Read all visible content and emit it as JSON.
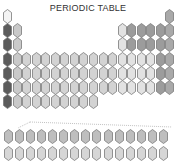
{
  "title": "PERIODIC TABLE",
  "colors": {
    "hydrogen": "#f4f4f4",
    "alkali": "#5c5c5c",
    "alkaline": "#c9c9c9",
    "transition": "#d3d3d3",
    "post_transition": "#e2e2e2",
    "pblock": "#9c9c9c",
    "noble": "#a9a9a9",
    "lanthanide": "#bebebe",
    "actinide": "#d6d6d6",
    "outline": "#7a7a7a"
  },
  "layout": {
    "columns": 18,
    "periods": 7,
    "f_block_rows": 2,
    "f_block_length": 15
  },
  "rows": [
    [
      "hydrogen",
      null,
      null,
      null,
      null,
      null,
      null,
      null,
      null,
      null,
      null,
      null,
      null,
      null,
      null,
      null,
      null,
      "noble"
    ],
    [
      "alkali",
      "alkaline",
      null,
      null,
      null,
      null,
      null,
      null,
      null,
      null,
      null,
      null,
      "post_transition",
      "pblock",
      "pblock",
      "pblock",
      "pblock",
      "noble"
    ],
    [
      "alkali",
      "alkaline",
      null,
      null,
      null,
      null,
      null,
      null,
      null,
      null,
      null,
      null,
      "post_transition",
      "pblock",
      "pblock",
      "pblock",
      "pblock",
      "noble"
    ],
    [
      "alkali",
      "alkaline",
      "transition",
      "transition",
      "transition",
      "transition",
      "transition",
      "transition",
      "transition",
      "transition",
      "transition",
      "transition",
      "post_transition",
      "post_transition",
      "post_transition",
      "post_transition",
      "pblock",
      "noble"
    ],
    [
      "alkali",
      "alkaline",
      "transition",
      "transition",
      "transition",
      "transition",
      "transition",
      "transition",
      "transition",
      "transition",
      "transition",
      "transition",
      "post_transition",
      "post_transition",
      "post_transition",
      "post_transition",
      "pblock",
      "noble"
    ],
    [
      "alkali",
      "alkaline",
      "transition",
      "transition",
      "transition",
      "transition",
      "transition",
      "transition",
      "transition",
      "transition",
      "transition",
      "transition",
      "post_transition",
      "post_transition",
      "post_transition",
      "post_transition",
      "pblock",
      "noble"
    ],
    [
      "alkali",
      "alkaline",
      "transition",
      "transition",
      "transition",
      "transition",
      "transition",
      "transition",
      "transition",
      "transition",
      null,
      null,
      null,
      null,
      null,
      null,
      null,
      null
    ]
  ],
  "f_block": [
    [
      "lanthanide",
      "lanthanide",
      "lanthanide",
      "lanthanide",
      "lanthanide",
      "lanthanide",
      "lanthanide",
      "lanthanide",
      "lanthanide",
      "lanthanide",
      "lanthanide",
      "lanthanide",
      "lanthanide",
      "lanthanide",
      "lanthanide"
    ],
    [
      "actinide",
      "actinide",
      "actinide",
      "actinide",
      "actinide",
      "actinide",
      "actinide",
      "actinide",
      "actinide",
      "actinide",
      "actinide",
      "actinide",
      "actinide",
      "actinide",
      "actinide"
    ]
  ]
}
